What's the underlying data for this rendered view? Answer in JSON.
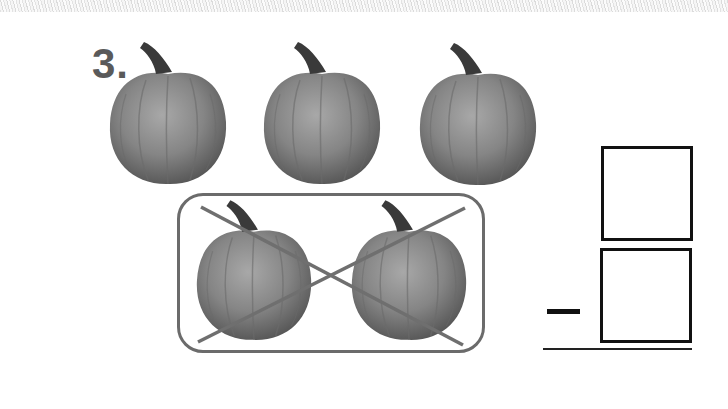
{
  "worksheet": {
    "problem_number": "3.",
    "operator": "minus",
    "colors": {
      "pumpkin_body": "#7d7d7d",
      "pumpkin_highlight": "#a3a3a3",
      "pumpkin_shadow": "#5a5a5a",
      "stem": "#3a3a3a",
      "group_border": "#6b6b6b",
      "cross_lines": "#6f6f6f",
      "box_border": "#111111",
      "number_text": "#5a5a5a"
    },
    "top_row": {
      "count": 3,
      "pumpkins": [
        {
          "label": "pumpkin-1",
          "crossed_out": false
        },
        {
          "label": "pumpkin-2",
          "crossed_out": false
        },
        {
          "label": "pumpkin-3",
          "crossed_out": false
        }
      ]
    },
    "grouped_row": {
      "count": 2,
      "circled": true,
      "crossed_out": true,
      "pumpkins": [
        {
          "label": "pumpkin-4",
          "crossed_out": true
        },
        {
          "label": "pumpkin-5",
          "crossed_out": true
        }
      ]
    },
    "answer_boxes": [
      {
        "position": "top",
        "value": ""
      },
      {
        "position": "bottom",
        "value": ""
      }
    ]
  }
}
